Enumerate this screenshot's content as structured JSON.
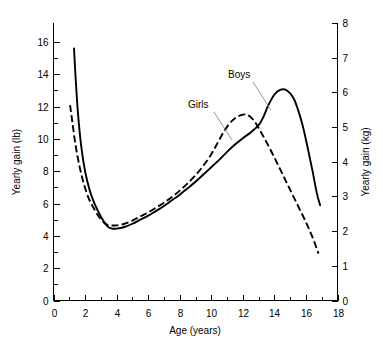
{
  "chart_data": {
    "type": "line",
    "title": "",
    "xlabel": "Age (years)",
    "ylabel": "Yearly gain (lb)",
    "ylabel_right": "Yearly gain (kg)",
    "xlim": [
      0,
      18
    ],
    "ylim": [
      0,
      17
    ],
    "ylim_right": [
      0,
      8
    ],
    "grid": false,
    "legend_position": "inline-annotations",
    "xticks": [
      0,
      2,
      4,
      6,
      8,
      10,
      12,
      14,
      16,
      18
    ],
    "xticks_labels": [
      "0",
      "2",
      "4",
      "6",
      "8",
      "10",
      "12",
      "14",
      "16",
      "18"
    ],
    "xticks_minor": [
      1,
      3,
      5,
      7,
      9,
      11,
      13,
      15,
      17
    ],
    "yticks": [
      0,
      2,
      4,
      6,
      8,
      10,
      12,
      14,
      16
    ],
    "yticks_labels": [
      "0",
      "2",
      "4",
      "6",
      "8",
      "10",
      "12",
      "14",
      "16"
    ],
    "yticks_minor": [
      1,
      3,
      5,
      7,
      9,
      11,
      13,
      15
    ],
    "yticks_right": [
      0,
      1,
      2,
      3,
      4,
      5,
      6,
      7,
      8
    ],
    "yticks_right_labels": [
      "0",
      "1",
      "2",
      "3",
      "4",
      "5",
      "6",
      "7",
      "8"
    ],
    "annotations": [
      {
        "text": "Boys",
        "x": 12.2,
        "y": 15.2
      },
      {
        "text": "Girls",
        "x": 9.2,
        "y": 12.2
      }
    ],
    "series": [
      {
        "name": "Boys",
        "style": "solid",
        "color": "#000000",
        "x": [
          1.3,
          1.4,
          1.55,
          1.75,
          2.0,
          2.3,
          2.6,
          3.0,
          3.4,
          3.7,
          4.0,
          4.5,
          5.0,
          5.5,
          6.0,
          6.5,
          7.0,
          7.5,
          8.0,
          8.5,
          9.0,
          9.5,
          10.0,
          10.5,
          11.0,
          11.5,
          12.0,
          12.5,
          13.0,
          13.3,
          13.6,
          14.0,
          14.4,
          14.8,
          15.2,
          15.5,
          15.8,
          16.1,
          16.4,
          16.7,
          16.9
        ],
        "y": [
          15.6,
          13.8,
          11.6,
          9.6,
          8.0,
          6.8,
          6.0,
          5.2,
          4.6,
          4.45,
          4.45,
          4.55,
          4.75,
          5.0,
          5.25,
          5.55,
          5.85,
          6.2,
          6.55,
          6.95,
          7.35,
          7.8,
          8.25,
          8.7,
          9.2,
          9.65,
          10.05,
          10.4,
          10.85,
          11.35,
          12.05,
          12.75,
          13.05,
          13.0,
          12.55,
          11.8,
          10.8,
          9.5,
          8.1,
          6.6,
          5.9
        ]
      },
      {
        "name": "Girls",
        "style": "dashed",
        "color": "#000000",
        "x": [
          1.05,
          1.2,
          1.4,
          1.65,
          1.9,
          2.2,
          2.5,
          2.9,
          3.3,
          3.6,
          4.0,
          4.5,
          5.0,
          5.5,
          6.0,
          6.5,
          7.0,
          7.5,
          8.0,
          8.5,
          9.0,
          9.5,
          10.0,
          10.4,
          10.8,
          11.2,
          11.6,
          12.0,
          12.25,
          12.5,
          12.8,
          13.1,
          13.5,
          14.0,
          14.5,
          15.0,
          15.5,
          16.0,
          16.4,
          16.8
        ],
        "y": [
          12.1,
          11.0,
          9.6,
          8.3,
          7.3,
          6.4,
          5.8,
          5.15,
          4.75,
          4.65,
          4.65,
          4.75,
          4.95,
          5.2,
          5.45,
          5.75,
          6.05,
          6.4,
          6.8,
          7.25,
          7.75,
          8.35,
          9.05,
          9.75,
          10.45,
          11.0,
          11.35,
          11.5,
          11.5,
          11.35,
          11.0,
          10.5,
          9.8,
          8.85,
          7.85,
          6.85,
          5.85,
          4.85,
          3.95,
          2.9
        ]
      }
    ]
  },
  "axes": {
    "x_title": "Age (years)",
    "y_left_title": "Yearly gain (lb)",
    "y_right_title": "Yearly gain (kg)"
  }
}
